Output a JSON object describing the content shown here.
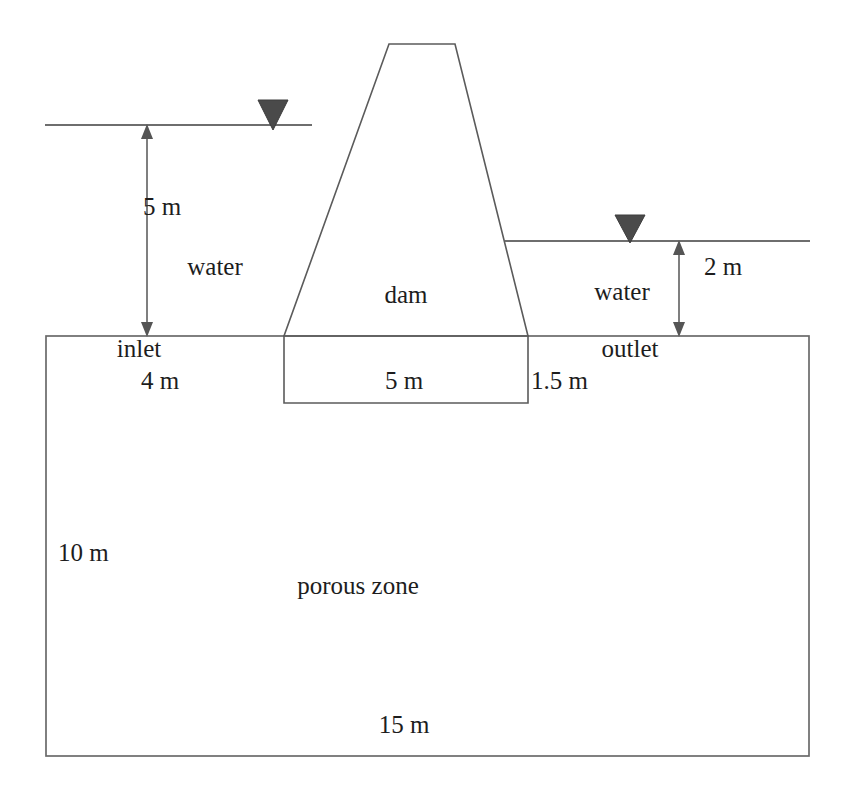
{
  "diagram": {
    "colors": {
      "line": "#5b5b5b",
      "outline": "#6a6a6a",
      "water_surface": "#6e6e6e",
      "dimension": "#555555",
      "water_table_marker": "#4a4a4a",
      "text": "#1d1d1d",
      "background": "#ffffff"
    },
    "labels": {
      "upstream_head": "5 m",
      "upstream_water": "water",
      "downstream_head": "2 m",
      "downstream_water": "water",
      "structure": "dam",
      "inlet": "inlet",
      "outlet": "outlet",
      "inlet_offset": "4 m",
      "dam_base_width": "5 m",
      "outlet_offset": "1.5 m",
      "zone": "porous zone",
      "zone_depth": "10 m",
      "zone_width": "15 m"
    },
    "markers": {
      "upstream_water_table": "water-table-triangle",
      "downstream_water_table": "water-table-triangle"
    },
    "dimensions": [
      {
        "name": "upstream-head",
        "value": 5,
        "unit": "m",
        "label": "5 m"
      },
      {
        "name": "downstream-head",
        "value": 2,
        "unit": "m",
        "label": "2 m"
      },
      {
        "name": "inlet-length",
        "value": 4,
        "unit": "m",
        "label": "4 m"
      },
      {
        "name": "dam-base-width",
        "value": 5,
        "unit": "m",
        "label": "5 m"
      },
      {
        "name": "outlet-length",
        "value": 1.5,
        "unit": "m",
        "label": "1.5 m"
      },
      {
        "name": "porous-zone-depth",
        "value": 10,
        "unit": "m",
        "label": "10 m"
      },
      {
        "name": "porous-zone-width",
        "value": 15,
        "unit": "m",
        "label": "15 m"
      }
    ]
  }
}
